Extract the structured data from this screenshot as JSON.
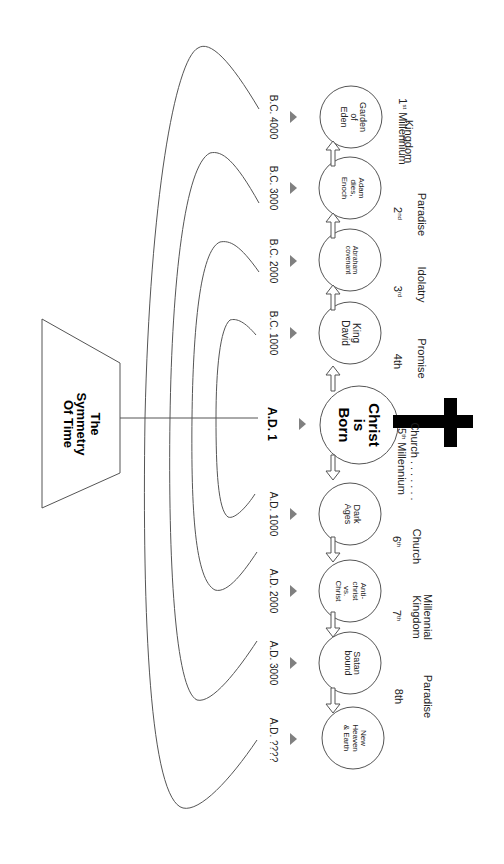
{
  "title": "The\nSymmetry\nOf Time",
  "orientation": "rotated 90deg clockwise",
  "colors": {
    "line": "#555555",
    "triangle": "#808080",
    "cross": "#000000",
    "background": "#ffffff"
  },
  "center_event": {
    "label": "Christ\nis\nBorn",
    "date": "A.D. 1",
    "icon": "cross-icon"
  },
  "events": [
    {
      "label": "Garden\nof\nEden",
      "date": "B.C. 4000"
    },
    {
      "label": "Adam\ndies,\nEnoch",
      "date": "B.C. 3000"
    },
    {
      "label": "Abraham\ncovenant",
      "date": "B.C. 2000"
    },
    {
      "label": "King\nDavid",
      "date": "B.C. 1000"
    },
    {
      "label": "Christ\nis\nBorn",
      "date": "A.D. 1"
    },
    {
      "label": "Dark\nAges",
      "date": "A.D. 1000"
    },
    {
      "label": "Anti-\nchrist\nvs.\nChrist",
      "date": "A.D. 2000"
    },
    {
      "label": "Satan\nbound",
      "date": "A.D. 3000"
    },
    {
      "label": "New\nHeaven\n& Earth",
      "date": "A.D. ????"
    }
  ],
  "millennia": [
    {
      "theme": "Kingdom",
      "ordinal": "1",
      "suffix": "st",
      "extra": " Millennium"
    },
    {
      "theme": "Paradise",
      "ordinal": "2",
      "suffix": "nd",
      "extra": ""
    },
    {
      "theme": "Idolatry",
      "ordinal": "3",
      "suffix": "rd",
      "extra": ""
    },
    {
      "theme": "Promise",
      "ordinal": "4th",
      "suffix": "",
      "extra": ""
    },
    {
      "theme": "Church . . . . . . .",
      "ordinal": "5",
      "suffix": "th",
      "extra": " Millennium"
    },
    {
      "theme": "Church",
      "ordinal": "6",
      "suffix": "th",
      "extra": ""
    },
    {
      "theme": "Millennial\nKingdom",
      "ordinal": "7",
      "suffix": "th",
      "extra": ""
    },
    {
      "theme": "Paradise",
      "ordinal": "8th",
      "suffix": "",
      "extra": ""
    }
  ],
  "symmetry_pairs": [
    {
      "from": "B.C. 4000",
      "to": "A.D. ????"
    },
    {
      "from": "B.C. 3000",
      "to": "A.D. 3000"
    },
    {
      "from": "B.C. 2000",
      "to": "A.D. 2000"
    },
    {
      "from": "B.C. 1000",
      "to": "A.D. 1000"
    }
  ]
}
